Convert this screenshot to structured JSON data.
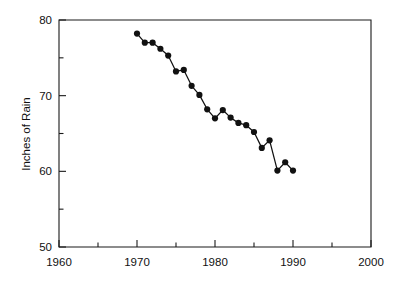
{
  "chart_data": {
    "type": "line",
    "title": "",
    "xlabel": "",
    "ylabel": "Inches of Rain",
    "xlim": [
      1960,
      2000
    ],
    "ylim": [
      50,
      80
    ],
    "grid": false,
    "legend": null,
    "x_major_ticks": [
      1960,
      1970,
      1980,
      1990,
      2000
    ],
    "x_minor_ticks": [
      1965,
      1975,
      1985,
      1995
    ],
    "y_major_ticks": [
      50,
      60,
      70,
      80
    ],
    "y_minor_ticks": [
      55,
      65,
      75
    ],
    "x_tick_labels": [
      "1960",
      "1970",
      "1980",
      "1990",
      "2000"
    ],
    "y_tick_labels": [
      "50",
      "60",
      "70",
      "80"
    ],
    "marker": "filled-circle",
    "series": [
      {
        "name": "Inches of Rain",
        "color": "#111111",
        "x": [
          1970,
          1971,
          1972,
          1973,
          1974,
          1975,
          1976,
          1977,
          1978,
          1979,
          1980,
          1981,
          1982,
          1983,
          1984,
          1985,
          1986,
          1987,
          1988,
          1989,
          1990
        ],
        "values": [
          78.2,
          77.0,
          77.0,
          76.2,
          75.3,
          73.2,
          73.4,
          71.3,
          70.1,
          68.2,
          67.0,
          68.1,
          67.1,
          66.4,
          66.1,
          65.2,
          63.1,
          64.1,
          60.1,
          61.2,
          60.1
        ]
      }
    ]
  },
  "axes": {
    "ylabel": "Inches of Rain"
  }
}
